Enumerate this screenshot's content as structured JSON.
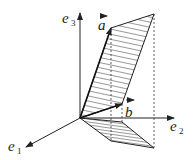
{
  "diagram": {
    "type": "vector-geometry",
    "axes": [
      {
        "name": "e1",
        "base": "e",
        "sub": "1"
      },
      {
        "name": "e2",
        "base": "e",
        "sub": "2"
      },
      {
        "name": "e3",
        "base": "e",
        "sub": "3"
      }
    ],
    "vectors": [
      {
        "name": "a",
        "label": "a"
      },
      {
        "name": "b",
        "label": "b"
      }
    ],
    "colors": {
      "stroke": "#222222",
      "hatch": "#333333",
      "background": "#ffffff"
    }
  }
}
